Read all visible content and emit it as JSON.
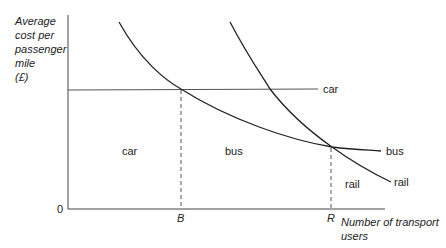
{
  "y_axis_label": [
    "Average",
    "cost per",
    "passenger",
    "mile",
    "(£)"
  ],
  "x_axis_label": [
    "Number of transport",
    "users"
  ],
  "origin_label": "0",
  "x_markers": {
    "b": "B",
    "r": "R"
  },
  "curve_labels": {
    "car": "car",
    "bus": "bus",
    "rail": "rail"
  },
  "region_labels": {
    "car": "car",
    "bus": "bus",
    "rail": "rail"
  },
  "colors": {
    "line": "#222222",
    "axis": "#444444"
  }
}
